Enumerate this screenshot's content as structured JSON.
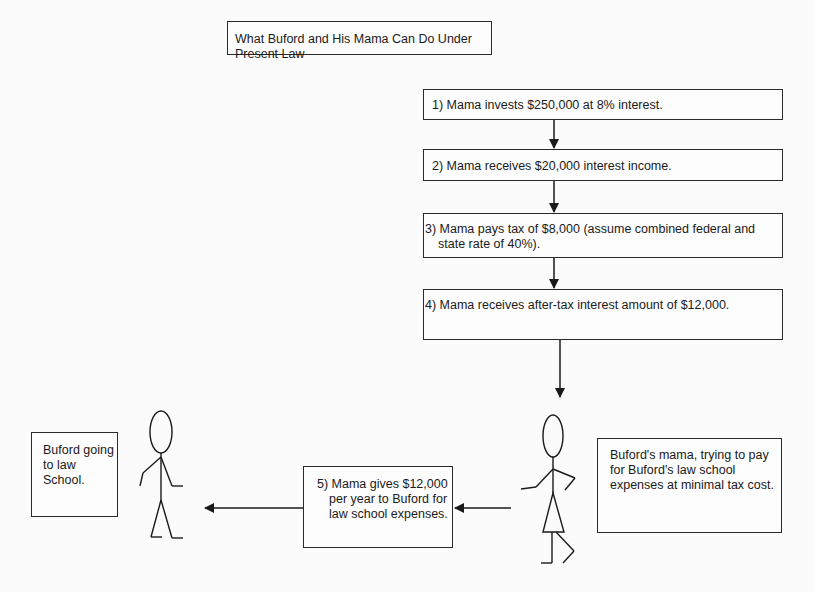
{
  "title": "What Buford and His Mama Can Do Under Present Law",
  "steps": [
    {
      "label": "1) Mama invests $250,000 at 8% interest."
    },
    {
      "label": "2) Mama receives $20,000 interest income."
    },
    {
      "label": "3) Mama pays tax of $8,000 (assume combined federal and state rate of 40%)."
    },
    {
      "label": "4) Mama receives after-tax interest amount of $12,000."
    },
    {
      "label": "5) Mama gives $12,000 per year to Buford for law school expenses."
    }
  ],
  "characters": {
    "buford": {
      "caption": "Buford going to law School.",
      "figure": "stick-figure-male"
    },
    "mama": {
      "caption": "Buford's mama, trying to pay for Buford's law school expenses at minimal tax cost.",
      "figure": "stick-figure-female"
    }
  },
  "colors": {
    "line": "#1a1a1a",
    "background": "#fbfbfb"
  }
}
